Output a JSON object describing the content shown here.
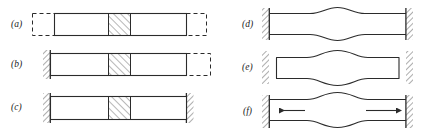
{
  "figure": {
    "stroke_color": "#2b2b2b",
    "hatch_color": "#4a4a4a",
    "background_color": "#ffffff",
    "dash_pattern": "4,3"
  },
  "panels": [
    {
      "id": "a",
      "label": "(a)",
      "description": "Unrestrained bar with dashed outline extensions at both ends and a cross-hatched central segment",
      "supports": "none",
      "bar_style": "solid",
      "has_hatched_block": true,
      "dashed_extension": "both-ends",
      "arrows": 0
    },
    {
      "id": "b",
      "label": "(b)",
      "description": "Bar fixed at the left wall, free at the right with a dashed outline extension, cross-hatched central segment",
      "supports": "left",
      "bar_style": "solid",
      "has_hatched_block": true,
      "dashed_extension": "right-end",
      "arrows": 0
    },
    {
      "id": "c",
      "label": "(c)",
      "description": "Bar fixed at both walls with a cross-hatched central segment",
      "supports": "both",
      "bar_style": "solid",
      "has_hatched_block": true,
      "dashed_extension": "none",
      "arrows": 0
    },
    {
      "id": "d",
      "label": "(d)",
      "description": "Bar fixed at both walls with a slight symmetric bulge at mid-span",
      "supports": "both",
      "bar_style": "bulged-small",
      "has_hatched_block": false,
      "dashed_extension": "none",
      "arrows": 0
    },
    {
      "id": "e",
      "label": "(e)",
      "description": "Detached bar with a pronounced symmetric bulge at mid-span, separated from both walls",
      "supports": "both",
      "bar_style": "bulged-large-detached",
      "has_hatched_block": false,
      "dashed_extension": "none",
      "arrows": 0
    },
    {
      "id": "f",
      "label": "(f)",
      "description": "Bar fixed at both walls with a mid-span bulge and two outward-pointing internal force arrows",
      "supports": "both",
      "bar_style": "bulged-medium",
      "has_hatched_block": false,
      "dashed_extension": "none",
      "arrows": 2,
      "arrow_directions": [
        "left",
        "right"
      ]
    }
  ]
}
